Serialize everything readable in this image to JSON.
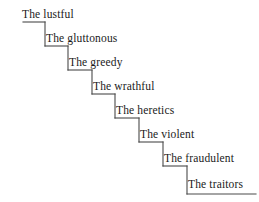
{
  "figure": {
    "type": "staircase-diagram",
    "background_color": "#ffffff",
    "line_color": "#4a4a4a",
    "text_color": "#1a1a1a",
    "width": 259,
    "height": 202,
    "step_count": 8
  },
  "steps": [
    {
      "label": "The lustful",
      "tread_y": 22,
      "tread_x1": 23,
      "tread_x2": 45,
      "text_x": 22,
      "text_y": 8
    },
    {
      "label": "The gluttonous",
      "tread_y": 46,
      "tread_x1": 45,
      "tread_x2": 68,
      "text_x": 46,
      "text_y": 32
    },
    {
      "label": "The greedy",
      "tread_y": 70,
      "tread_x1": 68,
      "tread_x2": 92,
      "text_x": 69,
      "text_y": 56
    },
    {
      "label": "The wrathful",
      "tread_y": 94,
      "tread_x1": 92,
      "tread_x2": 115,
      "text_x": 93,
      "text_y": 80
    },
    {
      "label": "The heretics",
      "tread_y": 118,
      "tread_x1": 115,
      "tread_x2": 139,
      "text_x": 116,
      "text_y": 104
    },
    {
      "label": "The violent",
      "tread_y": 142,
      "tread_x1": 139,
      "tread_x2": 163,
      "text_x": 140,
      "text_y": 128
    },
    {
      "label": "The fraudulent",
      "tread_y": 166,
      "tread_x1": 163,
      "tread_x2": 187,
      "text_x": 164,
      "text_y": 152
    },
    {
      "label": "The traitors",
      "tread_y": 194,
      "tread_x1": 187,
      "tread_x2": 256,
      "text_x": 188,
      "text_y": 178
    }
  ]
}
